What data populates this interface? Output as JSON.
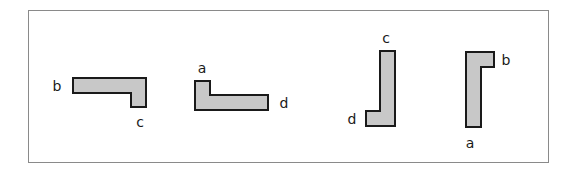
{
  "diagram": {
    "fill_color": "#c8c8c8",
    "stroke_color": "#1a1a1a",
    "frame_color": "#8a8a8a",
    "shapes": [
      {
        "id": "shape-1",
        "points": "73,78 146,78 146,107 131,107 131,93 73,93",
        "labels": [
          {
            "text": "b",
            "x": 57,
            "y": 86
          },
          {
            "text": "c",
            "x": 140,
            "y": 122
          }
        ]
      },
      {
        "id": "shape-2",
        "points": "195,81 210,81 210,95 268,95 268,110 195,110",
        "labels": [
          {
            "text": "a",
            "x": 202,
            "y": 68
          },
          {
            "text": "d",
            "x": 284,
            "y": 103
          }
        ]
      },
      {
        "id": "shape-3",
        "points": "380,51 395,51 395,126 366,126 366,111 380,111",
        "labels": [
          {
            "text": "c",
            "x": 386,
            "y": 38
          },
          {
            "text": "d",
            "x": 352,
            "y": 119
          }
        ]
      },
      {
        "id": "shape-4",
        "points": "466,52 494,52 494,67 481,67 481,127 466,127",
        "labels": [
          {
            "text": "b",
            "x": 506,
            "y": 60
          },
          {
            "text": "a",
            "x": 470,
            "y": 143
          }
        ]
      }
    ]
  }
}
